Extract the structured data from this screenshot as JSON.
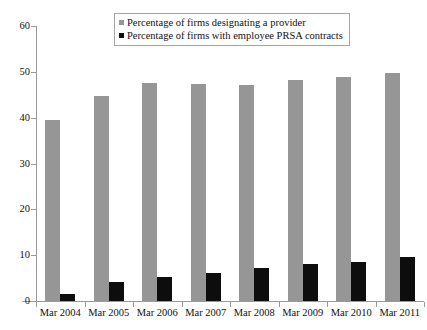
{
  "chart_data": {
    "type": "bar",
    "title": "",
    "xlabel": "",
    "ylabel": "",
    "ylim": [
      0,
      60
    ],
    "yticks": [
      0,
      10,
      20,
      30,
      40,
      50,
      60
    ],
    "grid": false,
    "legend_position": "top-center",
    "categories": [
      "Mar 2004",
      "Mar 2005",
      "Mar 2006",
      "Mar 2007",
      "Mar 2008",
      "Mar 2009",
      "Mar 2010",
      "Mar 2011"
    ],
    "series": [
      {
        "name": "Percentage of firms designating a provider",
        "color": "#969696",
        "values": [
          39.5,
          44.7,
          47.6,
          47.3,
          47.1,
          48.2,
          48.8,
          49.8
        ]
      },
      {
        "name": "Percentage of firms with employee PRSA contracts",
        "color": "#0d0d0d",
        "values": [
          1.6,
          4.2,
          5.3,
          6.2,
          7.2,
          8.1,
          8.6,
          9.5
        ]
      }
    ]
  },
  "legend": {
    "items": [
      {
        "label": "Percentage of firms designating a provider",
        "marker": "gray-square-icon"
      },
      {
        "label": "Percentage of firms with employee PRSA contracts",
        "marker": "black-square-icon"
      }
    ]
  },
  "axes": {
    "y_tick_labels": [
      "60",
      "50",
      "40",
      "30",
      "20",
      "10",
      "0"
    ],
    "x_tick_labels": [
      "Mar 2004",
      "Mar 2005",
      "Mar 2006",
      "Mar 2007",
      "Mar 2008",
      "Mar 2009",
      "Mar 2010",
      "Mar 2011"
    ]
  }
}
